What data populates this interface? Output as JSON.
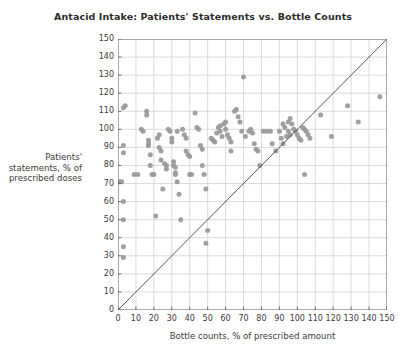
{
  "chart_data": {
    "type": "scatter",
    "title": "Antacid Intake: Patients' Statements vs. Bottle Counts",
    "xlabel": "Bottle counts, % of prescribed amount",
    "ylabel_lines": [
      "Patients'",
      "statements, % of",
      "prescribed doses"
    ],
    "ylabel": "Patients' statements, % of prescribed doses",
    "xlim": [
      0,
      150
    ],
    "ylim": [
      0,
      150
    ],
    "xticks": [
      0,
      10,
      20,
      30,
      40,
      50,
      60,
      70,
      80,
      90,
      100,
      110,
      120,
      130,
      140,
      150
    ],
    "yticks": [
      0,
      10,
      20,
      30,
      40,
      50,
      60,
      70,
      80,
      90,
      100,
      110,
      120,
      130,
      140,
      150
    ],
    "grid": true,
    "legend": null,
    "reference_line": {
      "name": "identity-line",
      "from": [
        0,
        0
      ],
      "to": [
        150,
        150
      ],
      "color": "#444444"
    },
    "marker": {
      "shape": "circle",
      "color": "#9a9a9a",
      "size_px": 5,
      "opacity": 0.95
    },
    "points": [
      [
        1,
        71
      ],
      [
        2,
        71
      ],
      [
        3,
        112
      ],
      [
        4,
        113
      ],
      [
        3,
        91
      ],
      [
        3,
        87
      ],
      [
        3,
        60
      ],
      [
        3,
        50
      ],
      [
        3,
        35
      ],
      [
        3,
        29
      ],
      [
        9,
        75
      ],
      [
        11,
        75
      ],
      [
        13,
        100
      ],
      [
        14,
        99
      ],
      [
        16,
        110
      ],
      [
        16,
        108
      ],
      [
        17,
        94
      ],
      [
        17,
        92
      ],
      [
        17,
        91
      ],
      [
        18,
        86
      ],
      [
        18,
        80
      ],
      [
        19,
        75
      ],
      [
        20,
        75
      ],
      [
        21,
        52
      ],
      [
        22,
        95
      ],
      [
        23,
        97
      ],
      [
        23,
        90
      ],
      [
        24,
        88
      ],
      [
        24,
        83
      ],
      [
        25,
        67
      ],
      [
        26,
        81
      ],
      [
        27,
        80
      ],
      [
        27,
        78
      ],
      [
        28,
        100
      ],
      [
        29,
        99
      ],
      [
        30,
        95
      ],
      [
        30,
        93
      ],
      [
        31,
        82
      ],
      [
        31,
        80
      ],
      [
        32,
        79
      ],
      [
        32,
        76
      ],
      [
        32,
        75
      ],
      [
        33,
        71
      ],
      [
        34,
        64
      ],
      [
        35,
        50
      ],
      [
        33,
        99
      ],
      [
        36,
        100
      ],
      [
        37,
        97
      ],
      [
        38,
        95
      ],
      [
        38,
        88
      ],
      [
        39,
        86
      ],
      [
        40,
        85
      ],
      [
        40,
        75
      ],
      [
        41,
        75
      ],
      [
        43,
        109
      ],
      [
        44,
        101
      ],
      [
        45,
        100
      ],
      [
        46,
        91
      ],
      [
        47,
        89
      ],
      [
        47,
        80
      ],
      [
        48,
        75
      ],
      [
        49,
        67
      ],
      [
        50,
        44
      ],
      [
        49,
        37
      ],
      [
        52,
        95
      ],
      [
        53,
        94
      ],
      [
        54,
        93
      ],
      [
        55,
        98
      ],
      [
        56,
        101
      ],
      [
        57,
        102
      ],
      [
        57,
        99
      ],
      [
        58,
        96
      ],
      [
        59,
        103
      ],
      [
        60,
        104
      ],
      [
        60,
        100
      ],
      [
        61,
        97
      ],
      [
        62,
        95
      ],
      [
        63,
        93
      ],
      [
        63,
        88
      ],
      [
        65,
        110
      ],
      [
        66,
        111
      ],
      [
        67,
        107
      ],
      [
        68,
        104
      ],
      [
        69,
        99
      ],
      [
        70,
        129
      ],
      [
        71,
        96
      ],
      [
        73,
        99
      ],
      [
        74,
        100
      ],
      [
        75,
        98
      ],
      [
        76,
        92
      ],
      [
        77,
        89
      ],
      [
        78,
        88
      ],
      [
        79,
        80
      ],
      [
        81,
        99
      ],
      [
        83,
        99
      ],
      [
        85,
        99
      ],
      [
        86,
        92
      ],
      [
        88,
        88
      ],
      [
        90,
        99
      ],
      [
        91,
        95
      ],
      [
        92,
        92
      ],
      [
        94,
        96
      ],
      [
        95,
        104
      ],
      [
        96,
        106
      ],
      [
        97,
        103
      ],
      [
        98,
        100
      ],
      [
        99,
        99
      ],
      [
        100,
        97
      ],
      [
        101,
        95
      ],
      [
        102,
        94
      ],
      [
        103,
        101
      ],
      [
        104,
        100
      ],
      [
        105,
        99
      ],
      [
        106,
        97
      ],
      [
        107,
        95
      ],
      [
        104,
        75
      ],
      [
        113,
        108
      ],
      [
        119,
        96
      ],
      [
        128,
        113
      ],
      [
        134,
        104
      ],
      [
        146,
        118
      ],
      [
        92,
        103
      ],
      [
        93,
        101
      ],
      [
        95,
        99
      ],
      [
        96,
        97
      ]
    ],
    "n_points": 124
  },
  "colors": {
    "background": "#ffffff",
    "axis": "#555555",
    "grid": "#cccccc",
    "text": "#3a3a3a",
    "marker": "#9a9a9a",
    "reference_line": "#444444"
  }
}
